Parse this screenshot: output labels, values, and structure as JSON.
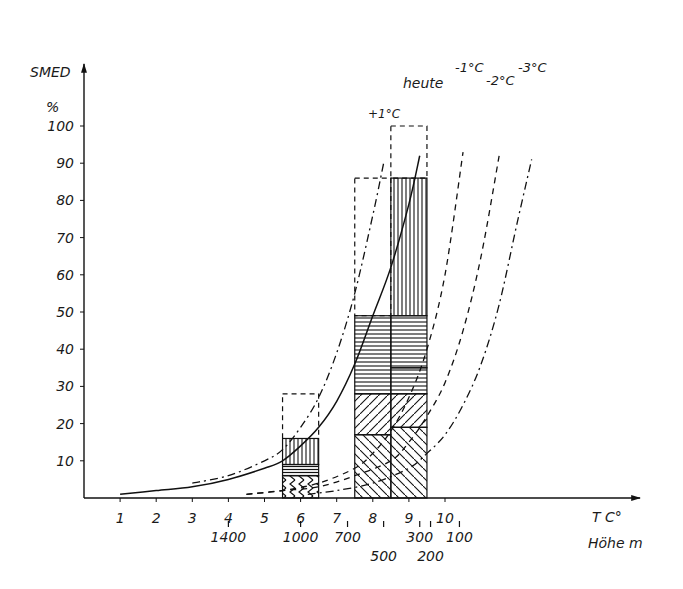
{
  "chart_data": {
    "type": "bar",
    "title": "",
    "ylabel": "SMED",
    "yunit": "%",
    "xlabel": "T C°",
    "xlabel_secondary": "Höhe m",
    "ylim": [
      0,
      100
    ],
    "xlim": [
      0,
      13
    ],
    "grid": false,
    "y_ticks": [
      10,
      20,
      30,
      40,
      50,
      60,
      70,
      80,
      90,
      100
    ],
    "x_ticks": [
      1,
      2,
      3,
      4,
      5,
      6,
      7,
      8,
      9,
      10
    ],
    "x_tick_labels": [
      "1",
      "2",
      "3",
      "4",
      "5",
      "6",
      "7",
      "8",
      "9",
      "10"
    ],
    "altitude_ticks": [
      {
        "label": "1400",
        "t": 4.0
      },
      {
        "label": "1000",
        "t": 6.0
      },
      {
        "label": "700",
        "t": 7.3
      },
      {
        "label": "500",
        "t": 8.3
      },
      {
        "label": "300",
        "t": 9.3
      },
      {
        "label": "200",
        "t": 9.6
      },
      {
        "label": "100",
        "t": 10.4
      }
    ],
    "bars": [
      {
        "x_from": 5.5,
        "x_to": 6.5,
        "segments": [
          {
            "from": 0,
            "to": 6,
            "hatch": "chevron"
          },
          {
            "from": 6,
            "to": 9,
            "hatch": "horizontal-dense"
          },
          {
            "from": 9,
            "to": 16,
            "hatch": "vertical"
          }
        ],
        "dashed_top": 28
      },
      {
        "x_from": 7.5,
        "x_to": 8.5,
        "segments": [
          {
            "from": 0,
            "to": 17,
            "hatch": "diagonal-back"
          },
          {
            "from": 17,
            "to": 28,
            "hatch": "diagonal-forward"
          },
          {
            "from": 28,
            "to": 49,
            "hatch": "horizontal"
          },
          {
            "from": 49,
            "to": 49,
            "hatch": "vertical"
          }
        ],
        "dashed_top": 86
      },
      {
        "x_from": 8.5,
        "x_to": 9.5,
        "segments": [
          {
            "from": 0,
            "to": 19,
            "hatch": "diagonal-back"
          },
          {
            "from": 19,
            "to": 28,
            "hatch": "diagonal-forward"
          },
          {
            "from": 28,
            "to": 35,
            "hatch": "horizontal"
          },
          {
            "from": 35,
            "to": 49,
            "hatch": "horizontal"
          },
          {
            "from": 49,
            "to": 86,
            "hatch": "vertical"
          }
        ],
        "dashed_top": 100
      }
    ],
    "series": [
      {
        "name": "heute",
        "style": "solid",
        "x": [
          1,
          2,
          3,
          4,
          5,
          5.5,
          6,
          6.5,
          7,
          7.5,
          8,
          8.5,
          9,
          9.3
        ],
        "values": [
          1,
          2,
          3,
          5,
          8,
          10,
          14,
          19,
          26,
          36,
          49,
          62,
          79,
          92
        ]
      },
      {
        "name": "+1°C",
        "style": "dash-dot",
        "x": [
          3,
          4,
          5,
          5.5,
          6,
          6.5,
          7,
          7.5,
          8,
          8.3
        ],
        "values": [
          4,
          6,
          10,
          13,
          19,
          27,
          39,
          55,
          76,
          90
        ]
      },
      {
        "name": "-1°C",
        "style": "dashed",
        "x": [
          4.5,
          5.5,
          6.5,
          7.5,
          8,
          8.5,
          9,
          9.5,
          10,
          10.5
        ],
        "values": [
          1,
          2,
          4,
          8,
          12,
          18,
          27,
          40,
          60,
          93
        ]
      },
      {
        "name": "-2°C",
        "style": "dashed",
        "x": [
          4.5,
          5.5,
          6.5,
          7.5,
          8.5,
          9,
          9.5,
          10,
          10.5,
          11,
          11.5
        ],
        "values": [
          1,
          2,
          3,
          6,
          10,
          15,
          22,
          31,
          45,
          65,
          92
        ]
      },
      {
        "name": "-3°C",
        "style": "dash-dot",
        "x": [
          6.2,
          7,
          8,
          9,
          9.5,
          10,
          10.5,
          11,
          11.5,
          12,
          12.4
        ],
        "values": [
          1,
          2,
          4,
          8,
          12,
          17,
          25,
          36,
          52,
          74,
          91
        ]
      }
    ],
    "annotations": [
      "heute",
      "+1°C",
      "-1°C",
      "-2°C",
      "-3°C"
    ]
  },
  "labels": {
    "y_axis_title": "SMED",
    "y_axis_unit": "%",
    "x_axis_title": "T C°",
    "x_axis_secondary_title": "Höhe m",
    "curve_heute": "heute",
    "curve_plus1": "+1°C",
    "curve_minus1": "-1°C",
    "curve_minus2": "-2°C",
    "curve_minus3": "-3°C"
  }
}
